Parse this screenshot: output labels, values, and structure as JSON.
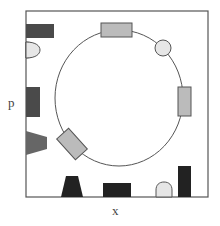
{
  "labels": {
    "y_axis": "p",
    "x_axis": "x"
  },
  "colors": {
    "border": "#555555",
    "dark": "#444444",
    "black": "#222222",
    "medium": "#666666",
    "light_gray": "#bbbbbb",
    "very_light": "#e6e6e6",
    "circle_track": "#555555"
  },
  "diagram": {
    "frame": {
      "x": 26,
      "y": 11,
      "w": 182,
      "h": 186
    },
    "track": {
      "cx": 119,
      "cy": 98,
      "rx": 64,
      "ry": 68
    },
    "shapes": [
      {
        "id": "left-top-rect",
        "type": "rect",
        "fill": "dark"
      },
      {
        "id": "left-half-disc",
        "type": "half-disc",
        "fill": "very_light"
      },
      {
        "id": "left-mid-rect",
        "type": "rect",
        "fill": "dark"
      },
      {
        "id": "left-trapezoid",
        "type": "trapezoid",
        "fill": "medium"
      },
      {
        "id": "bottom-trapezoid",
        "type": "trapezoid",
        "fill": "black"
      },
      {
        "id": "bottom-rect",
        "type": "rect",
        "fill": "black"
      },
      {
        "id": "bottom-dome",
        "type": "dome",
        "fill": "very_light"
      },
      {
        "id": "bottom-right-tall-rect",
        "type": "rect",
        "fill": "black"
      },
      {
        "id": "track-top-rect",
        "type": "rect",
        "fill": "light_gray"
      },
      {
        "id": "track-circle",
        "type": "circle",
        "fill": "very_light"
      },
      {
        "id": "track-right-rect",
        "type": "rect",
        "fill": "light_gray"
      },
      {
        "id": "track-tilted-rect",
        "type": "rotated-rect",
        "fill": "light_gray"
      }
    ]
  }
}
